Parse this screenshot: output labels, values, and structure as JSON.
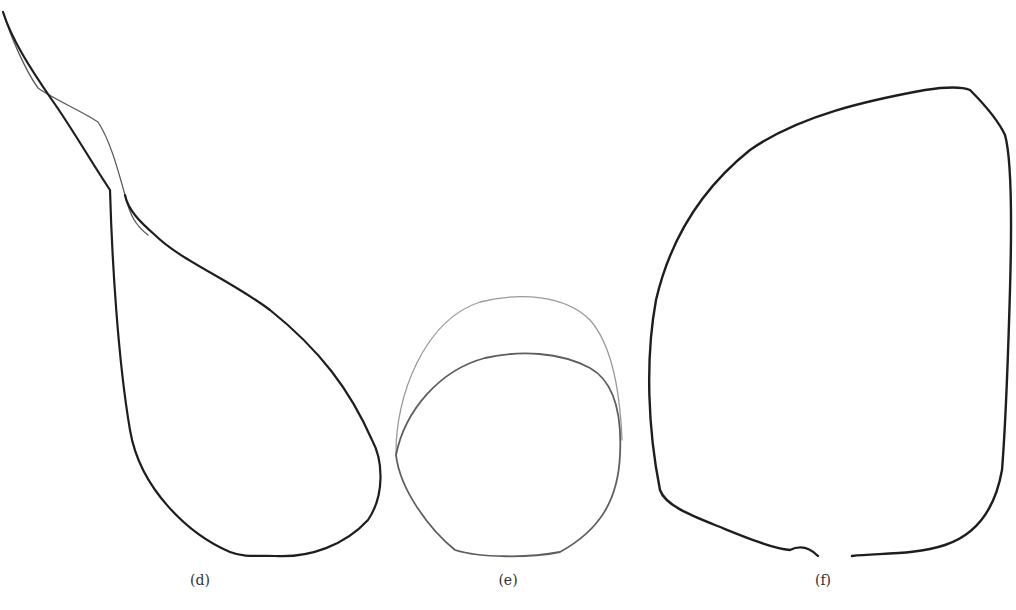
{
  "figure": {
    "panels": [
      {
        "id": "d",
        "label": "(d)",
        "label_letter": "d",
        "description": "Pear/drop shaped outline with long tapering upper tip; thin secondary outline along upper stem"
      },
      {
        "id": "e",
        "label": "(e)",
        "label_letter": "e",
        "description": "Two overlapping rounded outlines: faint larger dome and darker rounded contour"
      },
      {
        "id": "f",
        "label": "(f)",
        "label_letter": "f",
        "description": "Large shield/leaf-shaped outline with small gap at bottom center"
      }
    ],
    "caption": {
      "visible": "partially clipped at bottom edge",
      "text": ""
    },
    "colors": {
      "stroke_dark": "#1e1e1e",
      "stroke_light": "#8c8c8c",
      "background": "#ffffff"
    }
  }
}
